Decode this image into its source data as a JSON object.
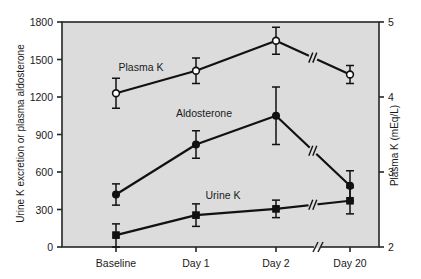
{
  "figure": {
    "background": "#ffffff",
    "plot_background": "#dcdcdc",
    "frame_color": "#262626",
    "ink_color": "#1a1a1a"
  },
  "chart_data": {
    "type": "line",
    "title": "",
    "subtitle": "",
    "xlabel": "",
    "ylabel": "Urine K excretion or plasma aldosterone",
    "y2label": "Plasma K (mEq/L)",
    "categories": [
      "Baseline",
      "Day 1",
      "Day 2",
      "Day 20"
    ],
    "x_axis_break_between": [
      "Day 2",
      "Day 20"
    ],
    "grid": false,
    "legend": "inline-annotations",
    "ylim": [
      0,
      1800
    ],
    "yticks": [
      0,
      300,
      600,
      900,
      1200,
      1500,
      1800
    ],
    "ytick_labels": [
      "0",
      "300",
      "600",
      "900",
      "1200",
      "1500",
      "1800"
    ],
    "y2lim": [
      2,
      5
    ],
    "y2ticks": [
      2,
      3,
      4,
      5
    ],
    "y2tick_labels": [
      "2",
      "3",
      "4",
      "5"
    ],
    "series": [
      {
        "name": "Plasma K",
        "axis": "right",
        "marker": "open-circle",
        "units": "mEq/L",
        "values": [
          4.05,
          4.35,
          4.75,
          4.3
        ],
        "err_low": [
          0.2,
          0.17,
          0.18,
          0.12
        ],
        "err_high": [
          0.2,
          0.17,
          0.18,
          0.12
        ],
        "label_text": "Plasma K",
        "has_line_break": true
      },
      {
        "name": "Aldosterone",
        "axis": "left",
        "marker": "filled-circle",
        "values": [
          420,
          820,
          1050,
          490
        ],
        "err_low": [
          85,
          110,
          230,
          120
        ],
        "err_high": [
          85,
          110,
          230,
          120
        ],
        "label_text": "Aldosterone",
        "has_line_break": true
      },
      {
        "name": "Urine K",
        "axis": "left",
        "marker": "filled-square",
        "values": [
          95,
          255,
          305,
          370
        ],
        "err_low": [
          95,
          90,
          70,
          105
        ],
        "err_high": [
          90,
          90,
          70,
          105
        ],
        "label_text": "Urine K",
        "has_line_break": true
      }
    ]
  },
  "annotations": {
    "plasma_k_label": "Plasma K",
    "aldosterone_label": "Aldosterone",
    "urine_k_label": "Urine K"
  }
}
